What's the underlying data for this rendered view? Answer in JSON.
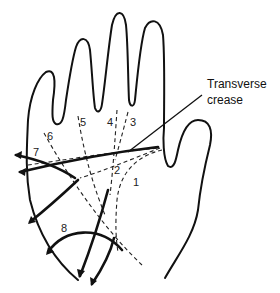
{
  "diagram": {
    "callout": {
      "line1": "Transverse",
      "line2": "crease"
    },
    "labels": [
      "1",
      "2",
      "3",
      "4",
      "5",
      "6",
      "7",
      "8"
    ],
    "colors": {
      "line": "#111111",
      "background": "#ffffff"
    }
  }
}
